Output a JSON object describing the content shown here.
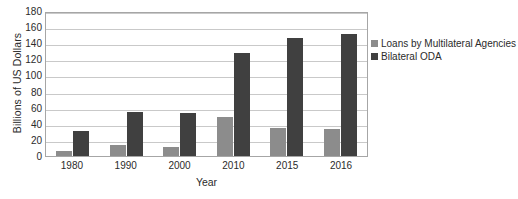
{
  "chart_data": {
    "type": "bar",
    "title": "",
    "xlabel": "Year",
    "ylabel": "Billions of US Dollars",
    "categories": [
      "1980",
      "1990",
      "2000",
      "2010",
      "2015",
      "2016"
    ],
    "series": [
      {
        "name": "Loans by Multilateral Agencies",
        "color": "#8c8c8c",
        "values": [
          6,
          14,
          11,
          48,
          35,
          34
        ]
      },
      {
        "name": "Bilateral ODA",
        "color": "#404040",
        "values": [
          31,
          55,
          53,
          128,
          147,
          152
        ]
      }
    ],
    "ylim": [
      0,
      180
    ],
    "ytick_step": 20,
    "yticks": [
      "180",
      "160",
      "140",
      "120",
      "100",
      "80",
      "60",
      "40",
      "20",
      "0"
    ],
    "grid": true,
    "legend_position": "right"
  }
}
